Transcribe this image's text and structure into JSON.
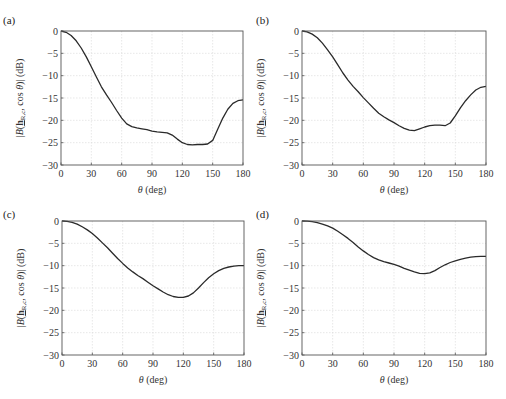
{
  "chart_data": [
    {
      "id": "a",
      "panel_label": "(a)",
      "type": "line",
      "xlabel": "θ (deg)",
      "ylabel": "|B(h_R,c, cos θ)| (dB)",
      "xlim": [
        0,
        180
      ],
      "ylim": [
        -30,
        0
      ],
      "xticks": [
        0,
        30,
        60,
        90,
        120,
        150,
        180
      ],
      "yticks": [
        0,
        -5,
        -10,
        -15,
        -20,
        -25,
        -30
      ],
      "grid": true,
      "series": [
        {
          "name": "beampattern",
          "x": [
            0,
            5,
            10,
            15,
            20,
            25,
            30,
            35,
            40,
            45,
            50,
            55,
            60,
            65,
            70,
            75,
            80,
            85,
            90,
            95,
            100,
            105,
            110,
            115,
            120,
            125,
            130,
            135,
            140,
            145,
            150,
            155,
            160,
            165,
            170,
            175,
            180
          ],
          "y": [
            0,
            -0.3,
            -1.0,
            -2.2,
            -3.8,
            -5.8,
            -8.0,
            -10.3,
            -12.5,
            -14.3,
            -16.0,
            -17.8,
            -19.5,
            -20.8,
            -21.4,
            -21.7,
            -21.9,
            -22.1,
            -22.4,
            -22.6,
            -22.7,
            -22.8,
            -23.3,
            -24.2,
            -25.0,
            -25.4,
            -25.5,
            -25.4,
            -25.4,
            -25.3,
            -24.5,
            -22.0,
            -19.5,
            -17.5,
            -16.2,
            -15.6,
            -15.4
          ]
        }
      ]
    },
    {
      "id": "b",
      "panel_label": "(b)",
      "type": "line",
      "xlabel": "θ (deg)",
      "ylabel": "|B(h_R,c, cos θ)| (dB)",
      "xlim": [
        0,
        180
      ],
      "ylim": [
        -30,
        0
      ],
      "xticks": [
        0,
        30,
        60,
        90,
        120,
        150,
        180
      ],
      "yticks": [
        0,
        -5,
        -10,
        -15,
        -20,
        -25,
        -30
      ],
      "grid": true,
      "series": [
        {
          "name": "beampattern",
          "x": [
            0,
            5,
            10,
            15,
            20,
            25,
            30,
            35,
            40,
            45,
            50,
            55,
            60,
            65,
            70,
            75,
            80,
            85,
            90,
            95,
            100,
            105,
            110,
            115,
            120,
            125,
            130,
            135,
            140,
            145,
            150,
            155,
            160,
            165,
            170,
            175,
            180
          ],
          "y": [
            0,
            -0.2,
            -0.7,
            -1.5,
            -2.7,
            -4.2,
            -5.8,
            -7.6,
            -9.4,
            -11.0,
            -12.4,
            -13.6,
            -14.9,
            -16.1,
            -17.3,
            -18.4,
            -19.2,
            -19.9,
            -20.5,
            -21.2,
            -21.8,
            -22.2,
            -22.3,
            -21.9,
            -21.5,
            -21.2,
            -21.1,
            -21.1,
            -21.2,
            -20.6,
            -19.0,
            -17.2,
            -15.6,
            -14.3,
            -13.2,
            -12.6,
            -12.4
          ]
        }
      ]
    },
    {
      "id": "c",
      "panel_label": "(c)",
      "type": "line",
      "xlabel": "θ (deg)",
      "ylabel": "|B(h_R,c, cos θ)| (dB)",
      "xlim": [
        0,
        180
      ],
      "ylim": [
        -30,
        0
      ],
      "xticks": [
        0,
        30,
        60,
        90,
        120,
        150,
        180
      ],
      "yticks": [
        0,
        -5,
        -10,
        -15,
        -20,
        -25,
        -30
      ],
      "grid": true,
      "series": [
        {
          "name": "beampattern",
          "x": [
            0,
            5,
            10,
            15,
            20,
            25,
            30,
            35,
            40,
            45,
            50,
            55,
            60,
            65,
            70,
            75,
            80,
            85,
            90,
            95,
            100,
            105,
            110,
            115,
            120,
            125,
            130,
            135,
            140,
            145,
            150,
            155,
            160,
            165,
            170,
            175,
            180
          ],
          "y": [
            0,
            -0.1,
            -0.3,
            -0.7,
            -1.3,
            -2.0,
            -2.8,
            -3.8,
            -4.9,
            -6.0,
            -7.2,
            -8.4,
            -9.5,
            -10.5,
            -11.4,
            -12.2,
            -12.9,
            -13.7,
            -14.5,
            -15.2,
            -15.9,
            -16.5,
            -16.9,
            -17.1,
            -17.1,
            -16.8,
            -16.1,
            -15.0,
            -13.8,
            -12.7,
            -11.8,
            -11.1,
            -10.6,
            -10.3,
            -10.1,
            -10.0,
            -10.0
          ]
        }
      ]
    },
    {
      "id": "d",
      "panel_label": "(d)",
      "type": "line",
      "xlabel": "θ (deg)",
      "ylabel": "|B(h_R,c, cos θ)| (dB)",
      "xlim": [
        0,
        180
      ],
      "ylim": [
        -30,
        0
      ],
      "xticks": [
        0,
        30,
        60,
        90,
        120,
        150,
        180
      ],
      "yticks": [
        0,
        -5,
        -10,
        -15,
        -20,
        -25,
        -30
      ],
      "grid": true,
      "series": [
        {
          "name": "beampattern",
          "x": [
            0,
            5,
            10,
            15,
            20,
            25,
            30,
            35,
            40,
            45,
            50,
            55,
            60,
            65,
            70,
            75,
            80,
            85,
            90,
            95,
            100,
            105,
            110,
            115,
            120,
            125,
            130,
            135,
            140,
            145,
            150,
            155,
            160,
            165,
            170,
            175,
            180
          ],
          "y": [
            0,
            -0.05,
            -0.15,
            -0.35,
            -0.7,
            -1.1,
            -1.6,
            -2.3,
            -3.1,
            -3.9,
            -4.8,
            -5.8,
            -6.7,
            -7.5,
            -8.2,
            -8.7,
            -9.1,
            -9.4,
            -9.7,
            -10.1,
            -10.6,
            -11.0,
            -11.4,
            -11.7,
            -11.8,
            -11.6,
            -11.1,
            -10.4,
            -9.8,
            -9.3,
            -8.9,
            -8.6,
            -8.3,
            -8.1,
            -8.0,
            -7.9,
            -7.9
          ]
        }
      ]
    }
  ],
  "layout": {
    "panels": [
      {
        "id": "a",
        "left": 0,
        "top": 0
      },
      {
        "id": "b",
        "left": 241,
        "top": 0
      },
      {
        "id": "c",
        "left": 0,
        "top": 190
      },
      {
        "id": "d",
        "left": 241,
        "top": 190
      }
    ]
  },
  "colors": {
    "curve": "#2a2a2a",
    "grid": "#d8d8d8",
    "frame": "#555555",
    "text": "#333333"
  }
}
